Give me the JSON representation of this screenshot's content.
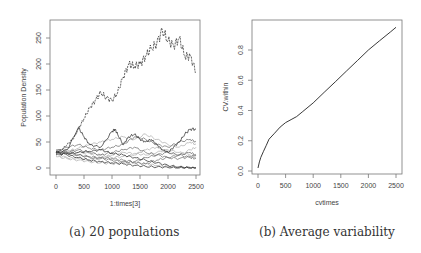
{
  "figure": {
    "captions": {
      "a": "(a) 20 populations",
      "b": "(b) Average variability"
    }
  },
  "colors": {
    "axis": "#777777",
    "text": "#444444",
    "line_dark": "#222222",
    "line_mid": "#666666",
    "line_light": "#aaaaaa"
  },
  "chart_data": [
    {
      "type": "line",
      "title": "",
      "caption": "(a) 20 populations",
      "xlabel": "1:times[3]",
      "ylabel": "Population Density",
      "xlim": [
        0,
        2500
      ],
      "ylim": [
        0,
        270
      ],
      "xticks": [
        0,
        500,
        1000,
        1500,
        2000,
        2500
      ],
      "yticks": [
        0,
        50,
        100,
        150,
        200,
        250
      ],
      "grid": false,
      "legend": null,
      "series": [
        {
          "name": "pop1",
          "shade": "dark",
          "x": [
            0,
            100,
            200,
            300,
            400,
            500,
            600,
            700,
            800,
            900,
            1000,
            1100,
            1200,
            1300,
            1400,
            1500,
            1600,
            1700,
            1800,
            1900,
            2000,
            2100,
            2200,
            2300,
            2400,
            2500
          ],
          "values": [
            30,
            35,
            45,
            55,
            75,
            95,
            115,
            130,
            145,
            135,
            130,
            145,
            175,
            200,
            195,
            200,
            215,
            230,
            240,
            265,
            245,
            235,
            250,
            215,
            215,
            185
          ]
        },
        {
          "name": "pop2",
          "shade": "dark",
          "x": [
            0,
            200,
            400,
            500,
            600,
            800,
            1000,
            1050,
            1100,
            1200,
            1300,
            1400,
            1500,
            1600,
            1700,
            1800,
            1900,
            2000,
            2100,
            2200,
            2300,
            2400,
            2500
          ],
          "values": [
            28,
            35,
            78,
            60,
            45,
            40,
            70,
            75,
            65,
            45,
            60,
            65,
            55,
            50,
            55,
            45,
            35,
            30,
            40,
            50,
            65,
            75,
            75
          ]
        },
        {
          "name": "pop3",
          "shade": "dark",
          "x": [
            0,
            200,
            400,
            600,
            800,
            1000,
            1200,
            1400,
            1600,
            1800,
            2000,
            2200,
            2400,
            2500
          ],
          "values": [
            25,
            28,
            30,
            32,
            35,
            28,
            25,
            20,
            15,
            10,
            5,
            2,
            0,
            0
          ]
        },
        {
          "name": "pop4",
          "shade": "dark",
          "x": [
            0,
            200,
            400,
            600,
            800,
            1000,
            1200,
            1400,
            1600,
            1800,
            2000,
            2200,
            2400,
            2500
          ],
          "values": [
            30,
            25,
            20,
            15,
            12,
            10,
            8,
            5,
            3,
            2,
            1,
            0,
            0,
            0
          ]
        },
        {
          "name": "pop5",
          "shade": "mid",
          "x": [
            0,
            200,
            400,
            600,
            800,
            1000,
            1200,
            1400,
            1600,
            1800,
            2000,
            2200,
            2400,
            2500
          ],
          "values": [
            32,
            40,
            45,
            38,
            35,
            40,
            45,
            60,
            55,
            45,
            40,
            50,
            55,
            50
          ]
        },
        {
          "name": "pop6",
          "shade": "mid",
          "x": [
            0,
            200,
            400,
            600,
            800,
            1000,
            1200,
            1400,
            1600,
            1800,
            2000,
            2200,
            2400,
            2500
          ],
          "values": [
            27,
            30,
            35,
            30,
            25,
            30,
            35,
            40,
            30,
            25,
            20,
            25,
            30,
            25
          ]
        },
        {
          "name": "pop7",
          "shade": "mid",
          "x": [
            0,
            200,
            400,
            600,
            800,
            1000,
            1200,
            1400,
            1600,
            1800,
            2000,
            2200,
            2400,
            2500
          ],
          "values": [
            30,
            28,
            25,
            22,
            20,
            18,
            15,
            12,
            20,
            25,
            30,
            25,
            20,
            18
          ]
        },
        {
          "name": "pop8",
          "shade": "light",
          "x": [
            0,
            200,
            400,
            600,
            800,
            1000,
            1200,
            1400,
            1600,
            1800,
            2000,
            2200,
            2400,
            2500
          ],
          "values": [
            28,
            32,
            38,
            45,
            50,
            55,
            60,
            55,
            65,
            55,
            45,
            40,
            50,
            45
          ]
        },
        {
          "name": "pop9",
          "shade": "light",
          "x": [
            0,
            200,
            400,
            600,
            800,
            1000,
            1200,
            1400,
            1600,
            1800,
            2000,
            2200,
            2400,
            2500
          ],
          "values": [
            25,
            20,
            18,
            15,
            20,
            25,
            30,
            28,
            25,
            30,
            35,
            30,
            25,
            20
          ]
        },
        {
          "name": "pop10",
          "shade": "light",
          "x": [
            0,
            200,
            400,
            600,
            800,
            1000,
            1200,
            1400,
            1600,
            1800,
            2000,
            2200,
            2400,
            2500
          ],
          "values": [
            30,
            35,
            30,
            28,
            25,
            20,
            22,
            25,
            35,
            40,
            30,
            25,
            35,
            40
          ]
        },
        {
          "name": "pop11",
          "shade": "light",
          "x": [
            0,
            200,
            400,
            600,
            800,
            1000,
            1200,
            1400,
            1600,
            1800,
            2000,
            2200,
            2400,
            2500
          ],
          "values": [
            22,
            18,
            15,
            12,
            10,
            8,
            10,
            12,
            8,
            5,
            3,
            2,
            1,
            0
          ]
        },
        {
          "name": "pop12",
          "shade": "mid",
          "x": [
            0,
            200,
            400,
            600,
            800,
            1000,
            1200,
            1400,
            1600,
            1800,
            2000,
            2200,
            2400,
            2500
          ],
          "values": [
            35,
            30,
            25,
            20,
            18,
            15,
            12,
            10,
            8,
            15,
            20,
            18,
            22,
            25
          ]
        }
      ]
    },
    {
      "type": "line",
      "title": "",
      "caption": "(b) Average variability",
      "xlabel": "cvtimes",
      "ylabel": "CV.within",
      "xlim": [
        0,
        2500
      ],
      "ylim": [
        0,
        0.96
      ],
      "xticks": [
        0,
        500,
        1000,
        1500,
        2000,
        2500
      ],
      "yticks": [
        0.0,
        0.2,
        0.4,
        0.6,
        0.8
      ],
      "grid": false,
      "legend": null,
      "series": [
        {
          "name": "CV.within",
          "x": [
            0,
            25,
            50,
            100,
            150,
            200,
            300,
            400,
            500,
            600,
            700,
            800,
            1000,
            1200,
            1400,
            1600,
            1800,
            2000,
            2200,
            2400,
            2500
          ],
          "values": [
            0.02,
            0.06,
            0.09,
            0.13,
            0.17,
            0.21,
            0.25,
            0.29,
            0.32,
            0.34,
            0.36,
            0.39,
            0.45,
            0.52,
            0.59,
            0.66,
            0.73,
            0.8,
            0.86,
            0.92,
            0.95
          ]
        }
      ]
    }
  ]
}
